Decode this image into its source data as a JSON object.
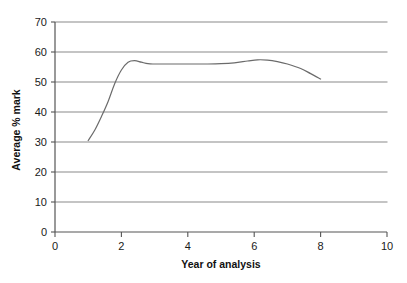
{
  "chart_data": {
    "type": "line",
    "title": "",
    "xlabel": "Year of analysis",
    "ylabel": "Average % mark",
    "xlim": [
      0,
      10
    ],
    "ylim": [
      0,
      70
    ],
    "xticks": [
      0,
      2,
      4,
      6,
      8,
      10
    ],
    "xtick_labels": [
      "0",
      "2",
      "4",
      "6",
      "8",
      "10"
    ],
    "yticks": [
      0,
      10,
      20,
      30,
      40,
      50,
      60,
      70
    ],
    "ytick_labels": [
      "0",
      "10",
      "20",
      "30",
      "40",
      "50",
      "60",
      "70"
    ],
    "grid": "horizontal",
    "legend": "none",
    "line_color": "#6b6b6b",
    "grid_color": "#8a8a8a",
    "axis_color": "#555555",
    "series": [
      {
        "name": "Average % mark",
        "x": [
          1.0,
          1.2,
          1.4,
          1.6,
          1.8,
          2.0,
          2.2,
          2.4,
          2.6,
          2.8,
          3.0,
          3.4,
          3.8,
          4.2,
          4.6,
          5.0,
          5.4,
          5.8,
          6.1,
          6.4,
          6.7,
          7.0,
          7.4,
          7.7,
          8.0
        ],
        "y": [
          30.5,
          34.0,
          38.5,
          43.5,
          49.5,
          54.0,
          56.6,
          57.1,
          56.6,
          56.1,
          56.0,
          56.0,
          56.0,
          56.0,
          56.0,
          56.1,
          56.4,
          57.0,
          57.4,
          57.3,
          56.8,
          56.0,
          54.5,
          52.8,
          51.0
        ]
      }
    ]
  },
  "axis_titles": {
    "x": "Year of analysis",
    "y": "Average % mark"
  }
}
